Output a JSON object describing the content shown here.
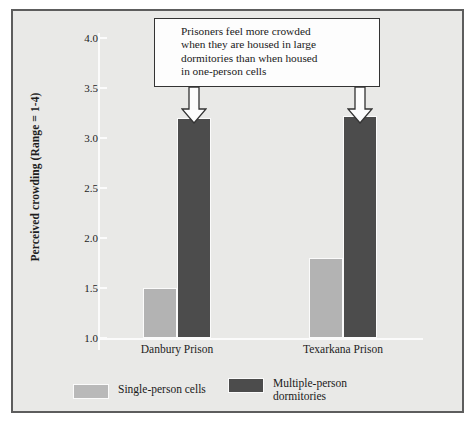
{
  "chart_data": {
    "type": "bar",
    "title": "",
    "xlabel": "",
    "ylabel": "Perceived crowding (Range = 1-4)",
    "categories": [
      "Danbury Prison",
      "Texarkana Prison"
    ],
    "series": [
      {
        "name": "Single-person cells",
        "values": [
          1.5,
          1.8
        ],
        "color": "#b3b3b3"
      },
      {
        "name": "Multiple-person\ndormitories",
        "values": [
          3.2,
          3.22
        ],
        "color": "#4c4c4c"
      }
    ],
    "ylim": [
      1.0,
      4.0
    ],
    "yticks": [
      "1.0",
      "1.5",
      "2.0",
      "2.5",
      "3.0",
      "3.5",
      "4.0"
    ],
    "ytick_values": [
      1.0,
      1.5,
      2.0,
      2.5,
      3.0,
      3.5,
      4.0
    ],
    "grid": false,
    "legend_position": "bottom",
    "annotations": [
      {
        "text": "Prisoners feel more crowded\nwhen they are housed in large\ndormitories than when housed\nin one-person cells",
        "points_to": [
          "Danbury Prison / Multiple-person dormitories",
          "Texarkana Prison / Multiple-person dormitories"
        ]
      }
    ]
  },
  "axis": {
    "y_label": "Perceived crowding (Range = 1-4)",
    "ticks": [
      "4.0",
      "3.5",
      "3.0",
      "2.5",
      "2.0",
      "1.5",
      "1.0"
    ]
  },
  "categories": {
    "left": "Danbury Prison",
    "right": "Texarkana Prison"
  },
  "callout": {
    "text": "Prisoners feel more crowded\nwhen they are housed in large\ndormitories than when housed\nin one-person cells"
  },
  "legend": {
    "light_label": "Single-person cells",
    "dark_label": "Multiple-person\ndormitories"
  },
  "colors": {
    "light_bar": "#b3b3b3",
    "dark_bar": "#4c4c4c",
    "background": "#e9e9e7",
    "frame": "#5d5d5d",
    "axis": "#fbfbfb",
    "text": "#1a1a1a"
  }
}
